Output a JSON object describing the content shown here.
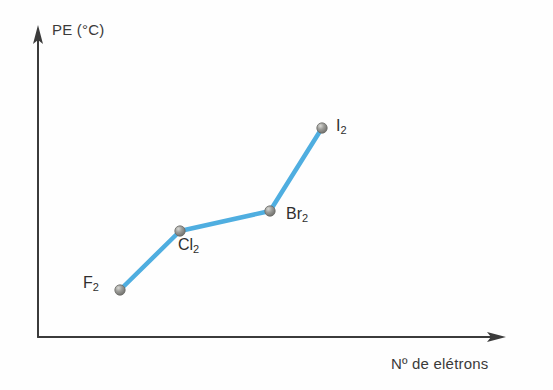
{
  "chart_data": {
    "type": "line",
    "title": "",
    "xlabel": "Nº de elétrons",
    "ylabel": "PE (°C)",
    "grid": false,
    "legend": "none",
    "axis_style": "arrow-tipped, no tick marks, no numeric scale",
    "line_color": "#4FAEE0",
    "marker_color": "#8a8a86",
    "axis_color": "#3b3b3b",
    "background_color": "#fefefe",
    "categories": [
      "F2",
      "Cl2",
      "Br2",
      "I2"
    ],
    "point_labels": [
      "F₂",
      "Cl₂",
      "Br₂",
      "I₂"
    ],
    "x": [
      120,
      180,
      270,
      322
    ],
    "y": [
      290,
      231,
      211,
      128
    ],
    "values_note": "Qualitative plot: boiling point increases with number of electrons; no numeric tick values shown",
    "xlim": [
      38,
      505
    ],
    "ylim": [
      337,
      28
    ],
    "series": [
      {
        "name": "Halogen boiling point trend",
        "points": [
          {
            "label": "F₂",
            "px": 120,
            "py": 290,
            "label_pos": "left"
          },
          {
            "label": "Cl₂",
            "px": 180,
            "py": 231,
            "label_pos": "below"
          },
          {
            "label": "Br₂",
            "px": 270,
            "py": 211,
            "label_pos": "right"
          },
          {
            "label": "I₂",
            "px": 322,
            "py": 128,
            "label_pos": "right"
          }
        ]
      }
    ]
  },
  "axes": {
    "y_label": "PE (°C)",
    "x_label": "Nº de elétrons"
  },
  "labels": {
    "f2": "F",
    "f2_sub": "2",
    "cl2": "Cl",
    "cl2_sub": "2",
    "br2": "Br",
    "br2_sub": "2",
    "i2": "I",
    "i2_sub": "2"
  }
}
